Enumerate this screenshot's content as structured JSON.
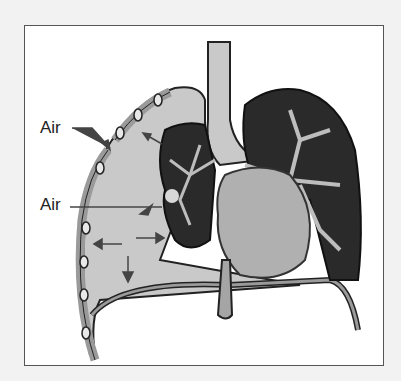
{
  "figure": {
    "labels": [
      {
        "text": "Air",
        "target": "chest-wall-opening"
      },
      {
        "text": "Air",
        "target": "lung-tear"
      }
    ],
    "colors": {
      "background": "#f2f2f2",
      "frame_fill": "#ffffff",
      "frame_border": "#555555",
      "pleural_space": "#c9c9c9",
      "lung_tissue": "#2a2a2a",
      "airways": "#bdbdbd",
      "heart": "#b0b0b0",
      "chest_wall": "#9a9a9a"
    },
    "arrows": [
      "air-entry-arrow",
      "air-escape-arrow",
      "expansion-arrow-up",
      "expansion-arrow-left",
      "expansion-arrow-right",
      "expansion-arrow-down"
    ]
  }
}
